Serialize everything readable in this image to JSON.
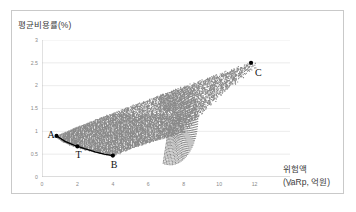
{
  "figure": {
    "background": "#ffffff",
    "frame_color": "#c9c9c9"
  },
  "chart_data": {
    "type": "scatter",
    "title": "",
    "ylabel": "평균비용률(%)",
    "xlabel_line1": "위험액",
    "xlabel_line2": "(VaRp, 억원)",
    "xlim": [
      0,
      14
    ],
    "ylim": [
      0,
      3
    ],
    "xticks": [
      0,
      2,
      4,
      6,
      8,
      10,
      12,
      14
    ],
    "xtick_labels": [
      "0",
      "2",
      "4",
      "6",
      "8",
      "10",
      "12",
      "14"
    ],
    "yticks": [
      0,
      0.5,
      1,
      1.5,
      2,
      2.5,
      3
    ],
    "ytick_labels": [
      "0",
      "0.5",
      "1",
      "1.5",
      "2",
      "2.5",
      "3"
    ],
    "grid": "horizontal",
    "grid_color": "#e4e4e4",
    "axis_color": "#b5b5b5",
    "legend": "none",
    "cloud": {
      "name": "feasible portfolio set",
      "color": "#808080",
      "marker": "circle",
      "marker_size": 1.1,
      "apex": [
        0.8,
        0.9
      ],
      "upper_edge_end": [
        11.8,
        2.5
      ],
      "lower_edge_min": [
        4.0,
        0.47
      ],
      "hook_center": [
        7.2,
        1.1
      ],
      "hook_extent_x": [
        6.3,
        8.0
      ],
      "hook_extent_y": [
        0.98,
        1.55
      ],
      "point_count_approx": 6000
    },
    "frontier_curve": {
      "name": "efficient frontier segment A-T-B",
      "color": "#000000",
      "width": 1.3,
      "points": [
        [
          0.82,
          0.9
        ],
        [
          1.3,
          0.78
        ],
        [
          1.8,
          0.7
        ],
        [
          2.4,
          0.62
        ],
        [
          3.0,
          0.55
        ],
        [
          3.5,
          0.5
        ],
        [
          4.0,
          0.47
        ]
      ]
    },
    "markers": [
      {
        "label": "A",
        "x": 0.82,
        "y": 0.9,
        "color": "#000000",
        "label_dx": -9,
        "label_dy": 3
      },
      {
        "label": "T",
        "x": 2.0,
        "y": 0.67,
        "color": "#000000",
        "label_dx": -2,
        "label_dy": 13
      },
      {
        "label": "B",
        "x": 4.0,
        "y": 0.47,
        "color": "#000000",
        "label_dx": -2,
        "label_dy": 13
      },
      {
        "label": "C",
        "x": 11.8,
        "y": 2.5,
        "color": "#000000",
        "label_dx": 4,
        "label_dy": 14
      }
    ]
  }
}
